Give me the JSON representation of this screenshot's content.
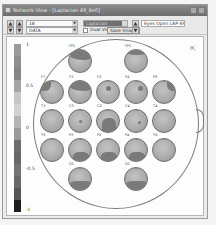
{
  "window": {
    "title": "Network View - [Laplacian 49_9e0]",
    "controls": [
      "minimize",
      "close"
    ]
  },
  "toolbar": {
    "combo1_value": "18",
    "combo2_value": "DATA",
    "combo3_value": "Laplacian",
    "checkbox_label": "Dual View",
    "checkbox_checked": false,
    "save_button": "Save Image",
    "info_text": "Eyes Open LAP 49_9e0"
  },
  "colorbar": {
    "ticks": [
      "1",
      "0.5",
      "0",
      "-0.5",
      "-1"
    ],
    "colors": [
      "#9a9a9a",
      "#8e8e8e",
      "#868686",
      "#a4a4a4",
      "#c6c6c6",
      "#d2d2d2",
      "#b4b4b4",
      "#9a9a9a",
      "#6e6e6e",
      "#686868",
      "#737373",
      "#696969",
      "#555555",
      "#1e1e1e"
    ]
  },
  "electrodes": [
    {
      "label": "FP1",
      "row": 0,
      "col": 1,
      "pattern": "top-dark"
    },
    {
      "label": "FP2",
      "row": 0,
      "col": 3,
      "pattern": "top-light"
    },
    {
      "label": "F7",
      "row": 1,
      "col": 0,
      "pattern": "left-top"
    },
    {
      "label": "F3",
      "row": 1,
      "col": 1,
      "pattern": "top-dark"
    },
    {
      "label": "FZ",
      "row": 1,
      "col": 2,
      "pattern": "spot"
    },
    {
      "label": "F4",
      "row": 1,
      "col": 3,
      "pattern": "spot-right"
    },
    {
      "label": "F8",
      "row": 1,
      "col": 4,
      "pattern": "right-top"
    },
    {
      "label": "T3",
      "row": 2,
      "col": 0,
      "pattern": "plain"
    },
    {
      "label": "C3",
      "row": 2,
      "col": 1,
      "pattern": "dot"
    },
    {
      "label": "CZ",
      "row": 2,
      "col": 2,
      "pattern": "bottom-big"
    },
    {
      "label": "C4",
      "row": 2,
      "col": 3,
      "pattern": "dot-right"
    },
    {
      "label": "T4",
      "row": 2,
      "col": 4,
      "pattern": "plain"
    },
    {
      "label": "T5",
      "row": 3,
      "col": 0,
      "pattern": "plain"
    },
    {
      "label": "P3",
      "row": 3,
      "col": 1,
      "pattern": "bottom"
    },
    {
      "label": "PZ",
      "row": 3,
      "col": 2,
      "pattern": "bottom"
    },
    {
      "label": "P4",
      "row": 3,
      "col": 3,
      "pattern": "bottom"
    },
    {
      "label": "T6",
      "row": 3,
      "col": 4,
      "pattern": "plain"
    },
    {
      "label": "O1",
      "row": 4,
      "col": 1,
      "pattern": "bottom-wide"
    },
    {
      "label": "O2",
      "row": 4,
      "col": 3,
      "pattern": "bottom-wide"
    }
  ]
}
